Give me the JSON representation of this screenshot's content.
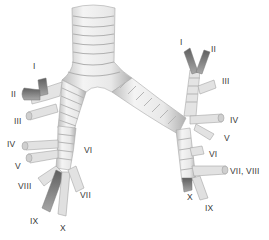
{
  "figure": {
    "colors": {
      "background": "#ffffff",
      "airway_fill": "#e6e6e6",
      "airway_light": "#f2f2f2",
      "airway_ring": "#b8b8b8",
      "airway_shadow": "#9a9a9a",
      "segment_dark": "#6e6e6e",
      "label_text": "#3a3a3a"
    },
    "left_side_labels": [
      {
        "text": "I",
        "x": 33,
        "y": 62
      },
      {
        "text": "II",
        "x": 11,
        "y": 90
      },
      {
        "text": "III",
        "x": 14,
        "y": 117
      },
      {
        "text": "IV",
        "x": 7,
        "y": 140
      },
      {
        "text": "V",
        "x": 15,
        "y": 162
      },
      {
        "text": "VI",
        "x": 84,
        "y": 146
      },
      {
        "text": "VIII",
        "x": 18,
        "y": 182
      },
      {
        "text": "VII",
        "x": 80,
        "y": 191
      },
      {
        "text": "IX",
        "x": 30,
        "y": 217
      },
      {
        "text": "X",
        "x": 60,
        "y": 224
      }
    ],
    "right_side_labels": [
      {
        "text": "I",
        "x": 180,
        "y": 38
      },
      {
        "text": "II",
        "x": 211,
        "y": 45
      },
      {
        "text": "III",
        "x": 222,
        "y": 77
      },
      {
        "text": "IV",
        "x": 230,
        "y": 116
      },
      {
        "text": "V",
        "x": 224,
        "y": 134
      },
      {
        "text": "VI",
        "x": 209,
        "y": 150
      },
      {
        "text": "VII, VIII",
        "x": 230,
        "y": 167
      },
      {
        "text": "X",
        "x": 187,
        "y": 193
      },
      {
        "text": "IX",
        "x": 205,
        "y": 204
      }
    ]
  }
}
